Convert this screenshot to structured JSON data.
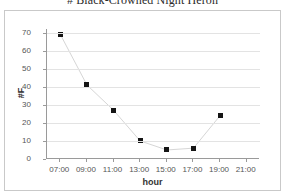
{
  "chart_data": {
    "type": "line",
    "title": "# Black-Crowned Night Heron",
    "xlabel": "hour",
    "ylabel": "#F",
    "categories": [
      "07:00",
      "09:00",
      "11:00",
      "13:00",
      "15:00",
      "17:00",
      "19:00",
      "21:00"
    ],
    "x_tick_labels": [
      "07:00",
      "09:00",
      "11:00",
      "13:00",
      "15:00",
      "17:00",
      "19:00",
      "21:00"
    ],
    "y_tick_labels": [
      "70",
      "60",
      "50",
      "40",
      "30",
      "20",
      "10",
      "0"
    ],
    "y_ticks": [
      70,
      60,
      50,
      40,
      30,
      20,
      10,
      0
    ],
    "ylim": [
      0,
      72
    ],
    "grid": "horizontal",
    "legend": "none",
    "marker": "square",
    "marker_color": "#151515",
    "line_color": "#d6d6d6",
    "series": [
      {
        "name": "# Black-Crowned Night Heron",
        "points": [
          {
            "x": "07:00",
            "y": 69
          },
          {
            "x": "09:00",
            "y": 41
          },
          {
            "x": "11:00",
            "y": 27
          },
          {
            "x": "13:00",
            "y": 10
          },
          {
            "x": "15:00",
            "y": 5
          },
          {
            "x": "17:00",
            "y": 6
          },
          {
            "x": "19:00",
            "y": 24
          }
        ]
      }
    ]
  }
}
